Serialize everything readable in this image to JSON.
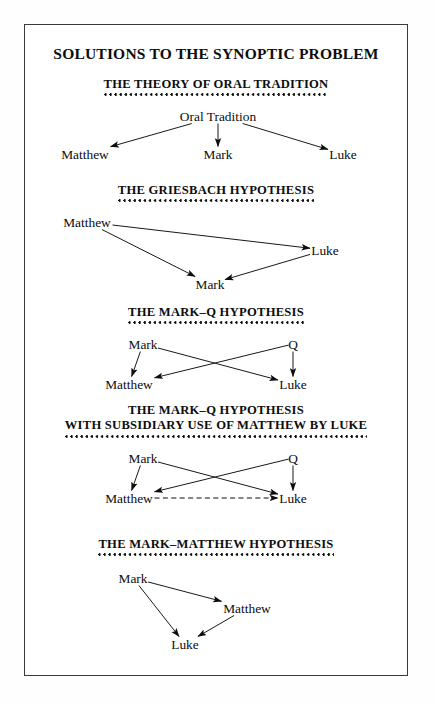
{
  "page": {
    "title": "SOLUTIONS TO THE SYNOPTIC PROBLEM",
    "background_color": "#fefefe",
    "frame_color": "#3a3a3a",
    "text_color": "#0d0d0d"
  },
  "chart_data": {
    "type": "diagram",
    "title": "SOLUTIONS TO THE SYNOPTIC PROBLEM",
    "diagrams": [
      {
        "id": "oral-tradition",
        "heading_lines": [
          "THE THEORY OF ORAL TRADITION"
        ],
        "nodes": [
          {
            "id": "oral",
            "label": "Oral Tradition",
            "x": 193,
            "y": 20
          },
          {
            "id": "matthew",
            "label": "Matthew",
            "x": 60,
            "y": 58
          },
          {
            "id": "mark",
            "label": "Mark",
            "x": 193,
            "y": 58
          },
          {
            "id": "luke",
            "label": "Luke",
            "x": 318,
            "y": 58
          }
        ],
        "edges": [
          {
            "from": "oral",
            "to": "matthew",
            "style": "solid"
          },
          {
            "from": "oral",
            "to": "mark",
            "style": "solid"
          },
          {
            "from": "oral",
            "to": "luke",
            "style": "solid"
          }
        ]
      },
      {
        "id": "griesbach",
        "heading_lines": [
          "THE GRIESBACH HYPOTHESIS"
        ],
        "nodes": [
          {
            "id": "matthew",
            "label": "Matthew",
            "x": 62,
            "y": 20
          },
          {
            "id": "luke",
            "label": "Luke",
            "x": 300,
            "y": 48
          },
          {
            "id": "mark",
            "label": "Mark",
            "x": 185,
            "y": 82
          }
        ],
        "edges": [
          {
            "from": "matthew",
            "to": "luke",
            "style": "solid"
          },
          {
            "from": "matthew",
            "to": "mark",
            "style": "solid"
          },
          {
            "from": "luke",
            "to": "mark",
            "style": "solid"
          }
        ]
      },
      {
        "id": "mark-q",
        "heading_lines": [
          "THE MARK–Q HYPOTHESIS"
        ],
        "nodes": [
          {
            "id": "mark",
            "label": "Mark",
            "x": 118,
            "y": 20
          },
          {
            "id": "q",
            "label": "Q",
            "x": 268,
            "y": 20
          },
          {
            "id": "matthew",
            "label": "Matthew",
            "x": 104,
            "y": 60
          },
          {
            "id": "luke",
            "label": "Luke",
            "x": 268,
            "y": 60
          }
        ],
        "edges": [
          {
            "from": "mark",
            "to": "matthew",
            "style": "solid"
          },
          {
            "from": "mark",
            "to": "luke",
            "style": "solid"
          },
          {
            "from": "q",
            "to": "matthew",
            "style": "solid"
          },
          {
            "from": "q",
            "to": "luke",
            "style": "solid"
          }
        ]
      },
      {
        "id": "mark-q-subsidiary",
        "heading_lines": [
          "THE MARK–Q HYPOTHESIS",
          "WITH SUBSIDIARY USE OF MATTHEW BY LUKE"
        ],
        "nodes": [
          {
            "id": "mark",
            "label": "Mark",
            "x": 118,
            "y": 20
          },
          {
            "id": "q",
            "label": "Q",
            "x": 268,
            "y": 20
          },
          {
            "id": "matthew",
            "label": "Matthew",
            "x": 104,
            "y": 60
          },
          {
            "id": "luke",
            "label": "Luke",
            "x": 268,
            "y": 60
          }
        ],
        "edges": [
          {
            "from": "mark",
            "to": "matthew",
            "style": "solid"
          },
          {
            "from": "mark",
            "to": "luke",
            "style": "solid"
          },
          {
            "from": "q",
            "to": "matthew",
            "style": "solid"
          },
          {
            "from": "q",
            "to": "luke",
            "style": "solid"
          },
          {
            "from": "matthew",
            "to": "luke",
            "style": "dashed"
          }
        ]
      },
      {
        "id": "mark-matthew",
        "heading_lines": [
          "THE MARK–MATTHEW HYPOTHESIS"
        ],
        "nodes": [
          {
            "id": "mark",
            "label": "Mark",
            "x": 108,
            "y": 22
          },
          {
            "id": "matthew",
            "label": "Matthew",
            "x": 222,
            "y": 52
          },
          {
            "id": "luke",
            "label": "Luke",
            "x": 160,
            "y": 88
          }
        ],
        "edges": [
          {
            "from": "mark",
            "to": "matthew",
            "style": "solid"
          },
          {
            "from": "mark",
            "to": "luke",
            "style": "solid"
          },
          {
            "from": "matthew",
            "to": "luke",
            "style": "solid"
          }
        ]
      }
    ]
  }
}
